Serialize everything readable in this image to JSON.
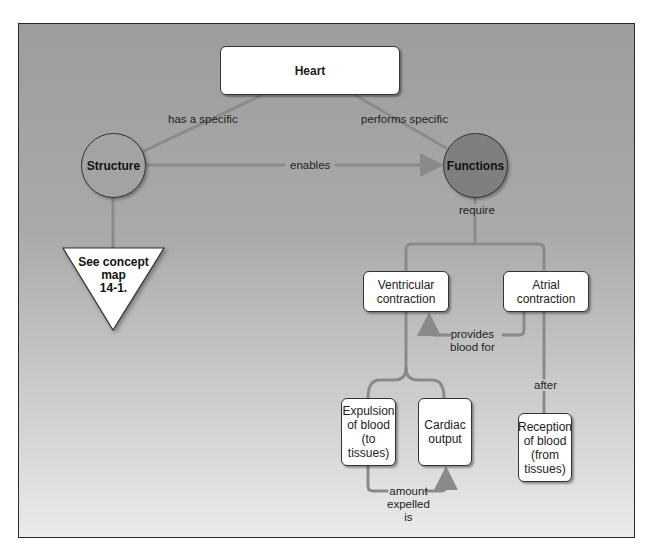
{
  "diagram": {
    "type": "concept-map",
    "colors": {
      "line": "#8a8a8a",
      "structure_fill": "#a3a3a3",
      "functions_fill": "#7f7f7f",
      "box_fill": "#ffffff",
      "frame_border": "#2a2a2a"
    },
    "nodes": {
      "heart": "Heart",
      "structure": "Structure",
      "functions": "Functions",
      "see_map": [
        "See concept",
        "map",
        "14-1."
      ],
      "ventricular": [
        "Ventricular",
        "contraction"
      ],
      "atrial": [
        "Atrial",
        "contraction"
      ],
      "expulsion": [
        "Expulsion",
        "of blood",
        "(to",
        "tissues)"
      ],
      "cardiac": [
        "Cardiac",
        "output"
      ],
      "reception": [
        "Reception",
        "of blood",
        "(from",
        "tissues)"
      ]
    },
    "links": {
      "has_specific": "has a specific",
      "performs_specific": "performs specific",
      "enables": "enables",
      "require": "require",
      "provides": [
        "provides",
        "blood for"
      ],
      "after": "after",
      "amount": [
        "amount",
        "expelled",
        "is"
      ]
    }
  }
}
